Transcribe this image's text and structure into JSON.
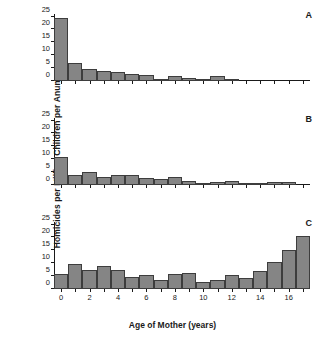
{
  "figure": {
    "y_axis_title": "Homicides per Million Children per Anum",
    "x_axis_title": "Age of Mother (years)"
  },
  "panels": [
    {
      "label": "A"
    },
    {
      "label": "B"
    },
    {
      "label": "C"
    }
  ],
  "chart_data": [
    {
      "type": "bar",
      "title": "A",
      "xlabel": "Age of Mother (years)",
      "ylabel": "Homicides per Million Children per Anum",
      "categories": [
        0,
        1,
        2,
        3,
        4,
        5,
        6,
        7,
        8,
        9,
        10,
        11,
        12,
        13,
        14,
        15,
        16,
        17
      ],
      "values": [
        24.5,
        7.0,
        4.6,
        4.0,
        3.5,
        2.7,
        2.2,
        0.9,
        2.1,
        1.1,
        0.6,
        2.1,
        0.6,
        0.0,
        0.0,
        0.0,
        0.0,
        0.0
      ],
      "ylim": [
        0,
        26
      ],
      "yticks": [
        0,
        5,
        10,
        15,
        20,
        25
      ],
      "xticks": [
        0,
        2,
        4,
        6,
        8,
        10,
        12,
        14,
        16
      ],
      "grid": false,
      "legend": "none",
      "bar_color": "#858585",
      "bar_edge_color": "#3d3d3d"
    },
    {
      "type": "bar",
      "title": "B",
      "xlabel": "Age of Mother (years)",
      "ylabel": "Homicides per Million Children per Anum",
      "categories": [
        0,
        1,
        2,
        3,
        4,
        5,
        6,
        7,
        8,
        9,
        10,
        11,
        12,
        13,
        14,
        15,
        16,
        17
      ],
      "values": [
        10.7,
        3.7,
        5.1,
        3.1,
        3.8,
        3.8,
        2.8,
        2.2,
        3.0,
        1.6,
        0.8,
        1.1,
        1.7,
        0.5,
        0.9,
        1.1,
        1.0,
        0.0
      ],
      "ylim": [
        0,
        26
      ],
      "yticks": [
        0,
        5,
        10,
        15,
        20,
        25
      ],
      "xticks": [
        0,
        2,
        4,
        6,
        8,
        10,
        12,
        14,
        16
      ],
      "grid": false,
      "legend": "none",
      "bar_color": "#858585",
      "bar_edge_color": "#3d3d3d"
    },
    {
      "type": "bar",
      "title": "C",
      "xlabel": "Age of Mother (years)",
      "ylabel": "Homicides per Million Children per Anum",
      "categories": [
        0,
        1,
        2,
        3,
        4,
        5,
        6,
        7,
        8,
        9,
        10,
        11,
        12,
        13,
        14,
        15,
        16,
        17
      ],
      "values": [
        5.7,
        9.6,
        7.5,
        9.0,
        7.5,
        4.5,
        5.6,
        3.6,
        5.7,
        6.1,
        2.9,
        3.6,
        5.3,
        4.1,
        6.8,
        10.6,
        15.3,
        20.4
      ],
      "ylim": [
        0,
        26
      ],
      "yticks": [
        0,
        5,
        10,
        15,
        20,
        25
      ],
      "xticks": [
        0,
        2,
        4,
        6,
        8,
        10,
        12,
        14,
        16
      ],
      "grid": false,
      "legend": "none",
      "bar_color": "#858585",
      "bar_edge_color": "#3d3d3d"
    }
  ]
}
